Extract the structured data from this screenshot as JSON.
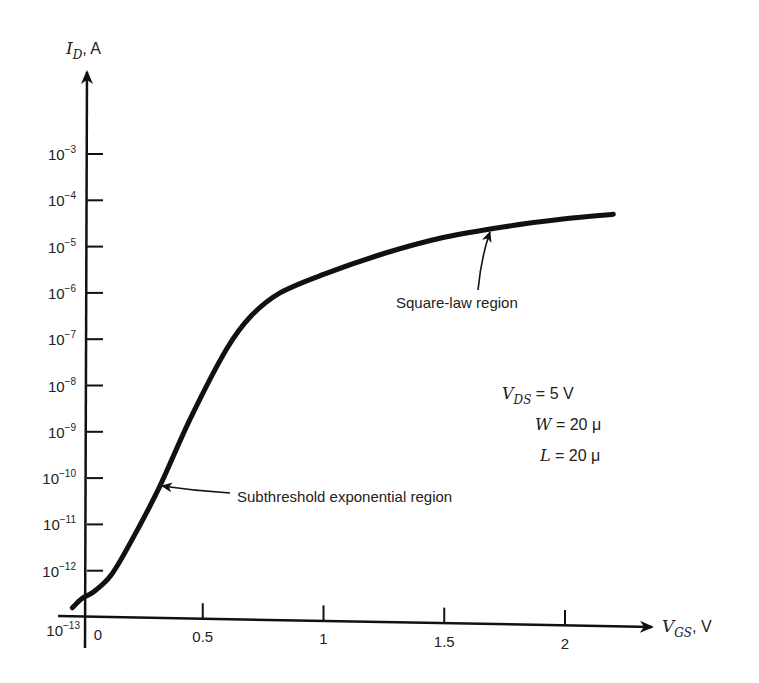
{
  "chart_data": {
    "type": "line",
    "title": "",
    "xlabel": "V_GS, V",
    "ylabel": "I_D, A",
    "xaxis": {
      "label_main": "V",
      "label_sub": "GS",
      "unit": ", V",
      "ticks": [
        {
          "value": 0,
          "label": "0"
        },
        {
          "value": 0.5,
          "label": "0.5"
        },
        {
          "value": 1,
          "label": "1"
        },
        {
          "value": 1.5,
          "label": "1.5"
        },
        {
          "value": 2,
          "label": "2"
        }
      ],
      "range": [
        -0.05,
        2.3
      ]
    },
    "yaxis": {
      "scale": "log",
      "label_main": "I",
      "label_sub": "D",
      "unit": ", A",
      "ticks": [
        {
          "exp": -3,
          "label": "10",
          "sup": "−3"
        },
        {
          "exp": -4,
          "label": "10",
          "sup": "−4"
        },
        {
          "exp": -5,
          "label": "10",
          "sup": "−5"
        },
        {
          "exp": -6,
          "label": "10",
          "sup": "−6"
        },
        {
          "exp": -7,
          "label": "10",
          "sup": "−7"
        },
        {
          "exp": -8,
          "label": "10",
          "sup": "−8"
        },
        {
          "exp": -9,
          "label": "10",
          "sup": "−9"
        },
        {
          "exp": -10,
          "label": "10",
          "sup": "−10"
        },
        {
          "exp": -11,
          "label": "10",
          "sup": "−11"
        },
        {
          "exp": -12,
          "label": "10",
          "sup": "−12"
        },
        {
          "exp": -13,
          "label": "10",
          "sup": "−13"
        }
      ],
      "range_exp": [
        -13,
        -2
      ]
    },
    "series": [
      {
        "name": "I_D vs V_GS",
        "x": [
          -0.04,
          0.0,
          0.05,
          0.12,
          0.2,
          0.32,
          0.45,
          0.6,
          0.7,
          0.82,
          1.0,
          1.25,
          1.5,
          1.75,
          2.0,
          2.2
        ],
        "log10_y": [
          -12.8,
          -12.6,
          -12.45,
          -12.1,
          -11.4,
          -10.2,
          -8.7,
          -7.2,
          -6.5,
          -6.0,
          -5.6,
          -5.15,
          -4.8,
          -4.57,
          -4.4,
          -4.3
        ]
      }
    ],
    "annotations": [
      {
        "text": "Square-law region",
        "points_to_x": 1.7,
        "points_to_log10_y": -4.6
      },
      {
        "text": "Subthreshold exponential region",
        "points_to_x": 0.32,
        "points_to_log10_y": -10.2
      }
    ],
    "parameters": [
      {
        "main": "V",
        "sub": "DS",
        "value": " = 5 V"
      },
      {
        "main": "W",
        "sub": "",
        "value": " = 20 μ"
      },
      {
        "main": "L",
        "sub": "",
        "value": " = 20 μ"
      }
    ],
    "grid": false,
    "legend": "none"
  }
}
